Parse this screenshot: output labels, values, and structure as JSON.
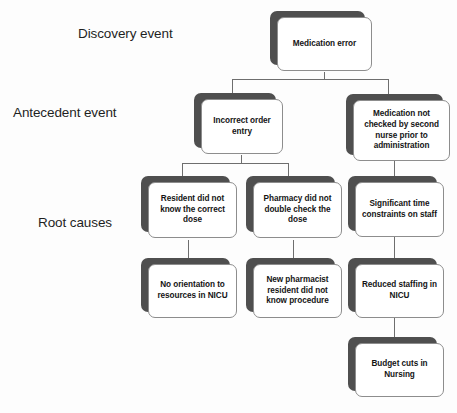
{
  "diagram": {
    "type": "root-cause-analysis-tree",
    "background_color": "#fdfdfd",
    "shadow_color": "#4f4f4f",
    "card_color": "#ffffff",
    "border_color": "#8d8d8d",
    "line_color": "#6e6e6e",
    "tier_labels": [
      {
        "id": "discovery",
        "text": "Discovery event"
      },
      {
        "id": "antecedent",
        "text": "Antecedent event"
      },
      {
        "id": "root",
        "text": "Root causes"
      }
    ],
    "nodes": [
      {
        "id": "medication-error",
        "text": "Medication error",
        "tier": "discovery"
      },
      {
        "id": "incorrect-order-entry",
        "text": "Incorrect order entry",
        "tier": "antecedent"
      },
      {
        "id": "medication-not-checked",
        "text": "Medication not checked by second nurse prior to administration",
        "tier": "antecedent"
      },
      {
        "id": "resident-dose",
        "text": "Resident did not know the correct dose",
        "tier": "root"
      },
      {
        "id": "pharmacy-double-check",
        "text": "Pharmacy did not double check the dose",
        "tier": "root"
      },
      {
        "id": "time-constraints",
        "text": "Significant time constraints on staff",
        "tier": "root"
      },
      {
        "id": "no-orientation",
        "text": "No orientation to resources in NICU",
        "tier": "root"
      },
      {
        "id": "new-pharmacist",
        "text": "New pharmacist resident did not know procedure",
        "tier": "root"
      },
      {
        "id": "reduced-staffing",
        "text": "Reduced staffing in NICU",
        "tier": "root"
      },
      {
        "id": "budget-cuts",
        "text": "Budget cuts in Nursing",
        "tier": "root"
      }
    ]
  }
}
